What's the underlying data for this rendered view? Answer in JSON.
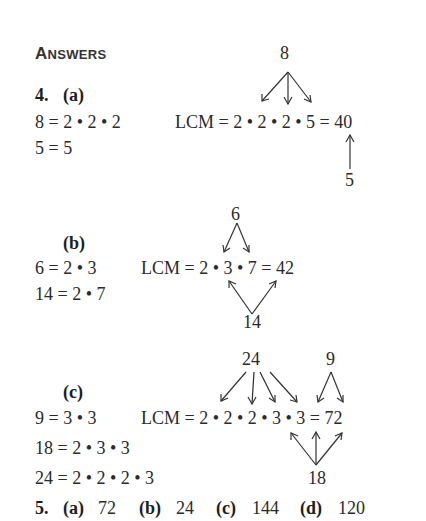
{
  "heading": {
    "first": "A",
    "rest": "NSWERS"
  },
  "problem4": {
    "number": "4.",
    "part_a": {
      "label": "(a)",
      "lines": [
        "8 = 2 • 2 • 2",
        "5 = 5"
      ],
      "lcm": "LCM = 2 • 2 • 2 • 5 = 40",
      "top_factor": "8",
      "bottom_factor": "5"
    },
    "part_b": {
      "label": "(b)",
      "lines": [
        "6 = 2 • 3",
        "14 = 2 • 7"
      ],
      "lcm": "LCM = 2 • 3 • 7 = 42",
      "top_factor": "6",
      "bottom_factor": "14"
    },
    "part_c": {
      "label": "(c)",
      "lines": [
        "9 = 3 • 3",
        "18 = 2 • 3 • 3",
        "24 = 2 • 2 • 2 • 3"
      ],
      "lcm": "LCM = 2 • 2 • 2 • 3 • 3 = 72",
      "top_factors": [
        "24",
        "9"
      ],
      "bottom_factor": "18"
    }
  },
  "problem5": {
    "number": "5.",
    "answers": [
      {
        "label": "(a)",
        "value": "72"
      },
      {
        "label": "(b)",
        "value": "24"
      },
      {
        "label": "(c)",
        "value": "144"
      },
      {
        "label": "(d)",
        "value": "120"
      }
    ]
  }
}
